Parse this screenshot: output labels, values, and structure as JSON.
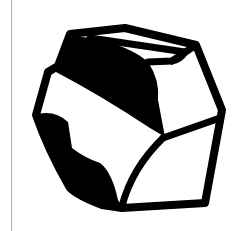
{
  "image": {
    "subject": "rock-icon",
    "description": "Black-and-white line icon of a faceted rock/stone",
    "colors": {
      "background": "#ffffff",
      "ink": "#000000",
      "divider": "#b4b4b4"
    }
  }
}
